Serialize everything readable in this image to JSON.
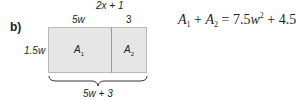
{
  "part_label": "b)",
  "top_expression": "2x + 1",
  "top_segments": {
    "left": "5w",
    "right": "3"
  },
  "side_label": "1.5w",
  "regions": [
    {
      "name": "A",
      "subscript": "1"
    },
    {
      "name": "A",
      "subscript": "2"
    }
  ],
  "bottom_label": "5w + 3",
  "equation": {
    "lhs_term1": "A",
    "lhs_sub1": "1",
    "plus": "+",
    "lhs_term2": "A",
    "lhs_sub2": "2",
    "equals": "=",
    "rhs_coef1": "7.5",
    "rhs_var1": "w",
    "rhs_exp1": "2",
    "rhs_plus": "+",
    "rhs_coef2": "4.5",
    "rhs_var2": "w"
  },
  "colors": {
    "fill": "#e6e6e6",
    "border": "#b9b9b9",
    "text": "#231f20"
  }
}
